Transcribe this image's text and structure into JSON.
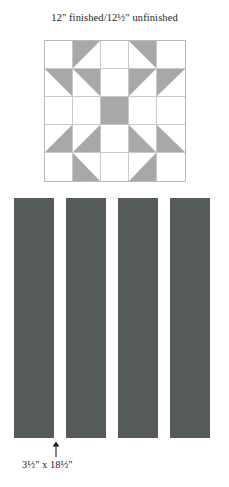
{
  "figure": {
    "title": "12\" finished/12½\" unfinished",
    "background_color": "#ffffff"
  },
  "block": {
    "name": "sawtooth-star-quilt-block",
    "grid_rows": 5,
    "grid_cols": 5,
    "patch_color": "#a8a8a8",
    "background_patch_color": "#ffffff",
    "grid_line_color": "#c9c9c9",
    "outline_color": "#b9b9b9",
    "cells": [
      {
        "r": 0,
        "c": 0,
        "shape": "blank"
      },
      {
        "r": 0,
        "c": 1,
        "shape": "tri-tl"
      },
      {
        "r": 0,
        "c": 2,
        "shape": "blank"
      },
      {
        "r": 0,
        "c": 3,
        "shape": "tri-tr"
      },
      {
        "r": 0,
        "c": 4,
        "shape": "blank"
      },
      {
        "r": 1,
        "c": 0,
        "shape": "tri-tr"
      },
      {
        "r": 1,
        "c": 1,
        "shape": "tri-tr"
      },
      {
        "r": 1,
        "c": 2,
        "shape": "blank"
      },
      {
        "r": 1,
        "c": 3,
        "shape": "tri-tl"
      },
      {
        "r": 1,
        "c": 4,
        "shape": "tri-tl"
      },
      {
        "r": 2,
        "c": 0,
        "shape": "blank"
      },
      {
        "r": 2,
        "c": 1,
        "shape": "blank"
      },
      {
        "r": 2,
        "c": 2,
        "shape": "solid"
      },
      {
        "r": 2,
        "c": 3,
        "shape": "blank"
      },
      {
        "r": 2,
        "c": 4,
        "shape": "blank"
      },
      {
        "r": 3,
        "c": 0,
        "shape": "tri-br"
      },
      {
        "r": 3,
        "c": 1,
        "shape": "tri-br"
      },
      {
        "r": 3,
        "c": 2,
        "shape": "blank"
      },
      {
        "r": 3,
        "c": 3,
        "shape": "tri-bl"
      },
      {
        "r": 3,
        "c": 4,
        "shape": "tri-bl"
      },
      {
        "r": 4,
        "c": 0,
        "shape": "blank"
      },
      {
        "r": 4,
        "c": 1,
        "shape": "tri-bl"
      },
      {
        "r": 4,
        "c": 2,
        "shape": "blank"
      },
      {
        "r": 4,
        "c": 3,
        "shape": "tri-br"
      },
      {
        "r": 4,
        "c": 4,
        "shape": "blank"
      }
    ]
  },
  "strips": {
    "count": 4,
    "color": "#555a5a",
    "caption": "3½\" x 18½\"",
    "arrow_icon": "arrow-up-icon"
  }
}
